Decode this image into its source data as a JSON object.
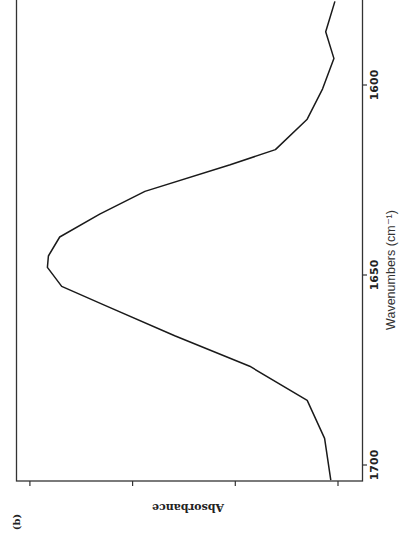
{
  "panel_label": "(b)",
  "chart_data": {
    "type": "line",
    "title": "",
    "panel": "(b)",
    "xlabel": "Wavenumbers (cm⁻¹)",
    "ylabel": "Absorbance",
    "x_ticks": [
      1700,
      1650,
      1600
    ],
    "x_tick_labels": [
      "1700",
      "1650",
      "1600"
    ],
    "y_ticks_unlabeled": [
      0,
      1,
      2,
      3
    ],
    "xlim": [
      1704,
      1578
    ],
    "ylim": [
      0,
      3.1
    ],
    "orientation": "rotated 90 degrees (wavenumber axis vertical on right, absorbance increasing to the left)",
    "grid": false,
    "legend": null,
    "series": [
      {
        "name": "Amide I band",
        "x": [
          1578,
          1586,
          1593,
          1601,
          1609,
          1617,
          1621,
          1628,
          1634,
          1640,
          1645,
          1648,
          1653,
          1658,
          1666,
          1674,
          1683,
          1693,
          1704
        ],
        "values": [
          0.03,
          0.12,
          0.04,
          0.15,
          0.3,
          0.61,
          1.05,
          1.88,
          2.32,
          2.71,
          2.82,
          2.83,
          2.69,
          2.27,
          1.59,
          0.86,
          0.3,
          0.13,
          0.07
        ]
      }
    ]
  }
}
